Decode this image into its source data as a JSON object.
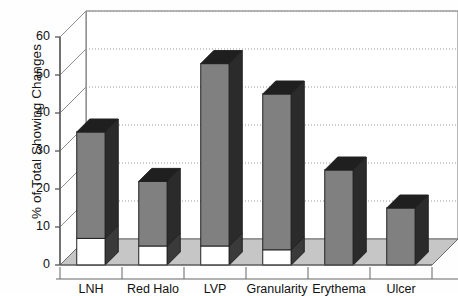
{
  "chart_data": {
    "type": "bar",
    "title": "",
    "subtitle": "",
    "xlabel": "",
    "ylabel": "% of Total Showing Changes",
    "categories": [
      "LNH",
      "Red Halo",
      "LVP",
      "Granularity",
      "Erythema",
      "Ulcer"
    ],
    "values": [
      35,
      22,
      53,
      45,
      25,
      15
    ],
    "series": [
      {
        "name": "lower-segment",
        "note": "white base portion of each bar",
        "values": [
          7,
          5,
          5,
          4,
          0,
          0
        ]
      },
      {
        "name": "upper-segment",
        "note": "gray portion of each bar",
        "values": [
          28,
          17,
          48,
          41,
          25,
          15
        ]
      }
    ],
    "ytick_labels": [
      "0",
      "10",
      "20",
      "30",
      "40",
      "50",
      "60"
    ],
    "ytick_values": [
      0,
      10,
      20,
      30,
      40,
      50,
      60
    ],
    "ylim": [
      0,
      60
    ],
    "grid": true,
    "grid_style": "dotted",
    "legend": false,
    "projection": "3d",
    "colors": {
      "bar_front": "#808080",
      "bar_side": "#2b2b2b",
      "bar_top": "#1f1f1f",
      "bar_base": "#ffffff",
      "floor": "#c6c6c6",
      "wall": "#ffffff",
      "axis_line": "#555555",
      "grid_line": "#9a9a9a",
      "text": "#111111"
    }
  }
}
